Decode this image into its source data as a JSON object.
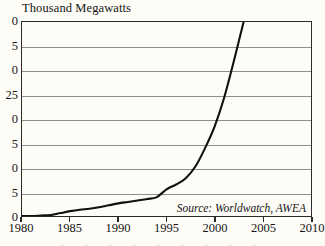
{
  "chart_data": {
    "type": "line",
    "title": "Thousand Megawatts",
    "xlabel": "",
    "ylabel": "Thousand Megawatts",
    "xlim": [
      1980,
      2010
    ],
    "ylim": [
      0,
      40
    ],
    "grid": true,
    "legend": null,
    "annotation": "Source: Worldwatch, AWEA",
    "x_ticks": [
      "1980",
      "1985",
      "1990",
      "1995",
      "2000",
      "2005",
      "2010"
    ],
    "x_tick_values": [
      1980,
      1985,
      1990,
      1995,
      2000,
      2005,
      2010
    ],
    "y_ticks": [
      "40",
      "35",
      "30",
      "25",
      "20",
      "15",
      "10",
      "5",
      "0"
    ],
    "y_tick_values": [
      40,
      35,
      30,
      25,
      20,
      15,
      10,
      5,
      0
    ],
    "y_ticks_rendered": [
      "0",
      "5",
      "0",
      "25",
      "0",
      "5",
      "0",
      "5",
      "0"
    ],
    "series": [
      {
        "name": "World wind energy generating capacity",
        "x": [
          1980,
          1981,
          1982,
          1983,
          1984,
          1985,
          1986,
          1987,
          1988,
          1989,
          1990,
          1991,
          1992,
          1993,
          1994,
          1995,
          1996,
          1997,
          1998,
          1999,
          2000,
          2001,
          2002,
          2003
        ],
        "values": [
          0.0,
          0.0,
          0.1,
          0.2,
          0.6,
          1.0,
          1.3,
          1.5,
          1.8,
          2.2,
          2.6,
          2.9,
          3.2,
          3.5,
          3.9,
          5.5,
          6.5,
          7.8,
          10.2,
          14.0,
          18.5,
          24.5,
          32.0,
          40.0
        ]
      }
    ]
  },
  "source_note": "Source: Worldwatch, AWEA"
}
